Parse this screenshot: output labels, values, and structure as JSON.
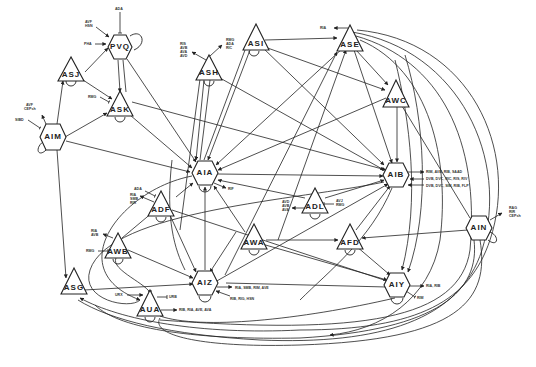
{
  "diagram": {
    "type": "regulatory network",
    "nodes": [
      {
        "id": "PVQ",
        "shape": "hexagon",
        "x": 120,
        "y": 47,
        "self_loop": true,
        "inputs": [
          "ADA",
          "AVF, HSN",
          "PHA"
        ]
      },
      {
        "id": "ASJ",
        "shape": "triangle",
        "x": 71,
        "y": 70,
        "self_loop": true,
        "inputs": []
      },
      {
        "id": "ASH",
        "shape": "triangle",
        "x": 209,
        "y": 70,
        "self_loop": true,
        "inputs": [
          "RIS, AVB, AVA, AVD",
          "RMG, ADA, RIC"
        ]
      },
      {
        "id": "ASI",
        "shape": "triangle",
        "x": 254,
        "y": 42,
        "self_loop": true,
        "inputs": []
      },
      {
        "id": "ASE",
        "shape": "triangle",
        "x": 349,
        "y": 42,
        "self_loop": false,
        "inputs": [
          "RIA"
        ]
      },
      {
        "id": "AWC",
        "shape": "triangle",
        "x": 396,
        "y": 95,
        "self_loop": false,
        "inputs": []
      },
      {
        "id": "ASK",
        "shape": "triangle",
        "x": 120,
        "y": 105,
        "self_loop": true,
        "inputs": [
          "RMG"
        ]
      },
      {
        "id": "AIM",
        "shape": "hexoid",
        "x": 53,
        "y": 137,
        "self_loop": true,
        "inputs": [
          "AVF, CEPsh",
          "SIBD"
        ]
      },
      {
        "id": "AIA",
        "shape": "hexagon",
        "x": 205,
        "y": 173,
        "self_loop": true,
        "inputs": [
          "RIF"
        ]
      },
      {
        "id": "AIB",
        "shape": "hexagon",
        "x": 396,
        "y": 175,
        "self_loop": false,
        "inputs": [
          "RIM, AVB, RIB, SAAD",
          "DVB, DVC, RIC, RIS, RIV",
          "DVB, DVC, SIM, RIB, FLP"
        ]
      },
      {
        "id": "ADL",
        "shape": "triangle",
        "x": 315,
        "y": 202,
        "self_loop": true,
        "inputs": [
          "AVD, AVB, AVA",
          "AVJ, RMG"
        ]
      },
      {
        "id": "ADF",
        "shape": "triangle",
        "x": 161,
        "y": 205,
        "self_loop": true,
        "inputs": [
          "ADA",
          "RIA, SMB, RIR"
        ]
      },
      {
        "id": "AFD",
        "shape": "triangle",
        "x": 350,
        "y": 238,
        "self_loop": true,
        "inputs": []
      },
      {
        "id": "AWA",
        "shape": "triangle",
        "x": 254,
        "y": 238,
        "self_loop": true,
        "inputs": []
      },
      {
        "id": "AIN",
        "shape": "hexagon",
        "x": 479,
        "y": 228,
        "self_loop": true,
        "inputs": [
          "RAG, RIR, CEPsh"
        ]
      },
      {
        "id": "AWB",
        "shape": "triangle",
        "x": 118,
        "y": 247,
        "self_loop": true,
        "inputs": [
          "RIA, AVB",
          "RMG"
        ]
      },
      {
        "id": "AIZ",
        "shape": "hexagon",
        "x": 205,
        "y": 283,
        "self_loop": true,
        "inputs": [
          "RIA, SMB, RIM, AVE",
          "RIB, RIG, HSN"
        ]
      },
      {
        "id": "AIY",
        "shape": "hexagon",
        "x": 397,
        "y": 285,
        "self_loop": true,
        "inputs": [
          "RIA, RIB",
          "RIM"
        ]
      },
      {
        "id": "ASG",
        "shape": "triangle",
        "x": 72,
        "y": 290,
        "self_loop": false,
        "inputs": []
      },
      {
        "id": "AUA",
        "shape": "triangle",
        "x": 150,
        "y": 306,
        "self_loop": true,
        "inputs": [
          "URX",
          "URB",
          "RIB, RIA, AVE, AVA"
        ]
      }
    ],
    "external_labels": {
      "pvq_ada": "ADA",
      "pvq_avf": "AVF",
      "pvq_hsn": "HSN",
      "pvq_pha": "PHA",
      "ash_ris": "RIS",
      "ash_avb": "AVB",
      "ash_ava": "AVA",
      "ash_avd": "AVD",
      "ash_rmg": "RMG",
      "ash_ada": "ADA",
      "ash_ric": "RIC",
      "ase_ria": "RIA",
      "ask_rmg": "RMG",
      "aim_avf": "AVF",
      "aim_ceps": "CEPsh",
      "aim_sibd": "SIBD",
      "aia_rif": "RIF",
      "aib_l1": "RIM, AVB, RIB, SAAD",
      "aib_l2": "DVB, DVC, RIC, RIS, RIV",
      "aib_l3": "DVB, DVC, SIM, RIB, FLP",
      "adl_l1a": "AVD",
      "adl_l1b": "AVB",
      "adl_l1c": "AVA",
      "adl_l2a": "AVJ",
      "adl_l2b": "RMG",
      "adf_ada": "ADA",
      "adf_ria": "RIA",
      "adf_smb": "SMB",
      "adf_rir": "RIR",
      "ain_rag": "RAG",
      "ain_rir": "RIR",
      "ain_ceps": "CEPsh",
      "awb_ria": "RIA",
      "awb_avb": "AVB",
      "awb_rmg": "RMG",
      "aiz_l1": "RIA, SMB, RIM, AVE",
      "aiz_l2": "RIB, RIG, HSN",
      "aiy_l1": "RIA, RIB",
      "aiy_l2": "RIM",
      "aua_urx": "URX",
      "aua_urb": "URB",
      "aua_out": "RIB, RIA, AVE, AVA"
    }
  }
}
